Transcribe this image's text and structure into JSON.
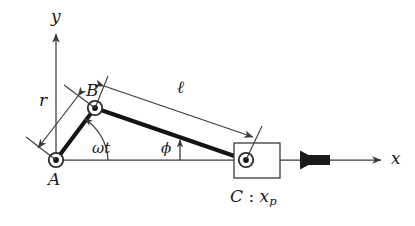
{
  "figure": {
    "type": "slider-crank-mechanism-diagram",
    "background_color": "#ffffff",
    "line_color": "#3a3a3a",
    "bold_member_color": "#141414",
    "force_arrow_color": "#1a1a1a"
  },
  "axes": {
    "x_label": "x",
    "y_label": "y",
    "origin_label": "A"
  },
  "points": [
    {
      "id": "A",
      "label": "A",
      "x": 56,
      "y": 160,
      "role": "crank-pivot"
    },
    {
      "id": "B",
      "label": "B",
      "x": 95,
      "y": 108,
      "role": "crank-pin"
    },
    {
      "id": "C",
      "label": "C",
      "x": 246,
      "y": 160,
      "role": "slider-pin"
    }
  ],
  "labels": {
    "point_a": "A",
    "point_b": "B",
    "slider_caption_prefix": "C",
    "slider_caption_sep": " : ",
    "slider_caption_var": "x",
    "slider_caption_sub": "p",
    "crank_length": "r",
    "rod_length": "ℓ",
    "crank_angle": "ωt",
    "rod_angle": "ϕ",
    "x_axis": "x",
    "y_axis": "y"
  },
  "members": [
    {
      "name": "crank-AB",
      "from": "A",
      "to": "B",
      "style": "bold"
    },
    {
      "name": "connecting-rod-BC",
      "from": "B",
      "to": "C",
      "style": "bold"
    }
  ],
  "dimensions": [
    {
      "name": "crank-radius",
      "label": "r",
      "kind": "double-arrow",
      "measures": "A-B"
    },
    {
      "name": "rod-length",
      "label": "ℓ",
      "kind": "double-arrow",
      "measures": "B-C"
    }
  ],
  "angles": [
    {
      "name": "crank-angle",
      "label": "ωt",
      "vertex": "A",
      "from": "x-axis",
      "to": "crank-AB"
    },
    {
      "name": "rod-angle",
      "label": "ϕ",
      "vertex": "C",
      "from": "x-axis",
      "to": "connecting-rod-BC"
    }
  ],
  "slider": {
    "name": "piston-block",
    "x": 234,
    "y": 143,
    "width": 46,
    "height": 35
  },
  "force": {
    "name": "applied-force-arrow",
    "direction": "leftward",
    "label": ""
  }
}
